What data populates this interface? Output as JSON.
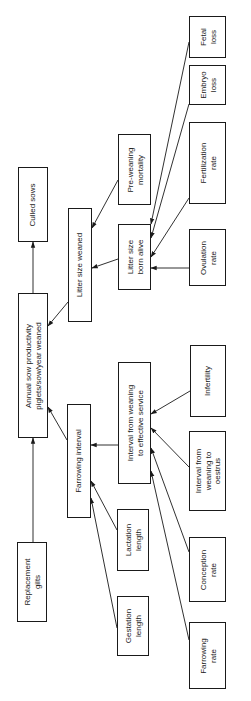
{
  "diagram": {
    "orientation": "rotated -90deg (text reads bottom-to-top)",
    "stroke_color": "#1a1a1a",
    "background_color": "#ffffff",
    "nodes": {
      "culled_sows": {
        "label": "Culled sows"
      },
      "annual_productivity": {
        "label": "Annual sow productivity\npiglets/sow/year weaned"
      },
      "replacement_gilts": {
        "label": "Replacement\ngilts"
      },
      "litter_size_weaned": {
        "label": "Litter size weaned"
      },
      "farrowing_interval": {
        "label": "Farrowing interval"
      },
      "pre_weaning_mortality": {
        "label": "Pre-weaning\nmortality"
      },
      "litter_size_born_alive": {
        "label": "Litter size\nborn alive"
      },
      "interval_weaning_service": {
        "label": "Interval from weaning\nto effective service"
      },
      "lactation_length": {
        "label": "Lactation\nlength"
      },
      "gestation_length": {
        "label": "Gestation\nlength"
      },
      "fetal_loss": {
        "label": "Fetal\nloss"
      },
      "embryo_loss": {
        "label": "Embryo\nloss"
      },
      "fertilization_rate": {
        "label": "Fertilization\nrate"
      },
      "ovulation_rate": {
        "label": "Ovulation\nrate"
      },
      "infertility": {
        "label": "Infertility"
      },
      "interval_weaning_oestrus": {
        "label": "Interval from\nweaning to\noestrus"
      },
      "conception_rate": {
        "label": "Conception\nrate"
      },
      "farrowing_rate": {
        "label": "Farrowing\nrate"
      }
    },
    "edges": [
      {
        "from": "annual_productivity",
        "to": "culled_sows"
      },
      {
        "from": "replacement_gilts",
        "to": "annual_productivity"
      },
      {
        "from": "litter_size_weaned",
        "to": "annual_productivity"
      },
      {
        "from": "farrowing_interval",
        "to": "annual_productivity"
      },
      {
        "from": "pre_weaning_mortality",
        "to": "litter_size_weaned"
      },
      {
        "from": "litter_size_born_alive",
        "to": "litter_size_weaned"
      },
      {
        "from": "interval_weaning_service",
        "to": "farrowing_interval"
      },
      {
        "from": "lactation_length",
        "to": "farrowing_interval"
      },
      {
        "from": "gestation_length",
        "to": "farrowing_interval"
      },
      {
        "from": "fetal_loss",
        "to": "litter_size_born_alive"
      },
      {
        "from": "embryo_loss",
        "to": "litter_size_born_alive"
      },
      {
        "from": "fertilization_rate",
        "to": "litter_size_born_alive"
      },
      {
        "from": "ovulation_rate",
        "to": "litter_size_born_alive"
      },
      {
        "from": "infertility",
        "to": "interval_weaning_service"
      },
      {
        "from": "interval_weaning_oestrus",
        "to": "interval_weaning_service"
      },
      {
        "from": "conception_rate",
        "to": "interval_weaning_service"
      },
      {
        "from": "farrowing_rate",
        "to": "interval_weaning_service"
      }
    ]
  }
}
